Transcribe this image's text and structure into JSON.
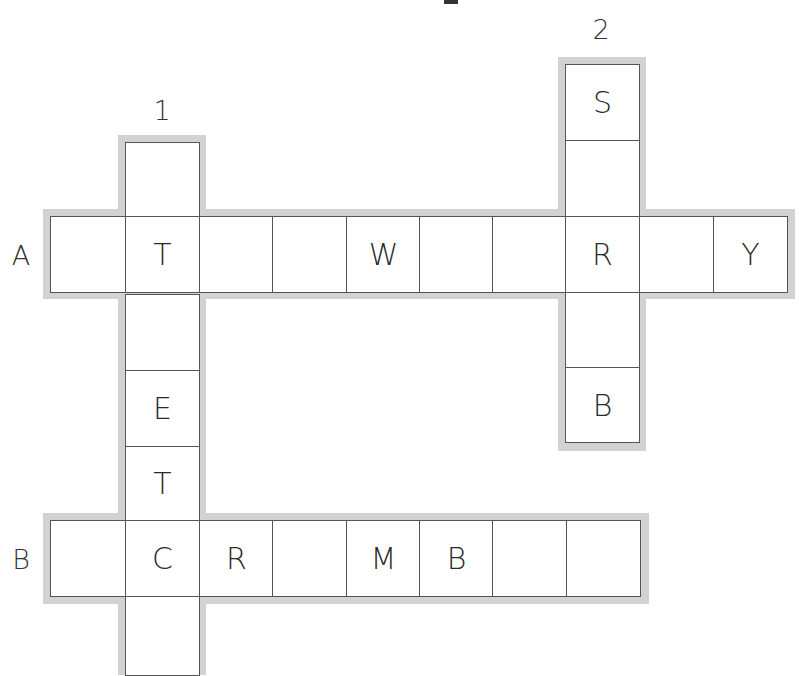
{
  "puzzle": {
    "down_numbers": [
      "1",
      "2"
    ],
    "across_labels": [
      "A",
      "B"
    ],
    "across_A": [
      "",
      "T",
      "",
      "",
      "W",
      "",
      "",
      "R",
      "",
      "Y"
    ],
    "across_B": [
      "",
      "C",
      "R",
      "",
      "M",
      "B",
      "",
      ""
    ],
    "down_1": [
      "",
      "",
      "",
      "E",
      "T",
      "",
      ""
    ],
    "down_2": [
      "S",
      "",
      "",
      "",
      "B"
    ]
  },
  "colors": {
    "shadow": "#d2d2d2",
    "border": "#555555",
    "text": "#2a2a2a"
  }
}
